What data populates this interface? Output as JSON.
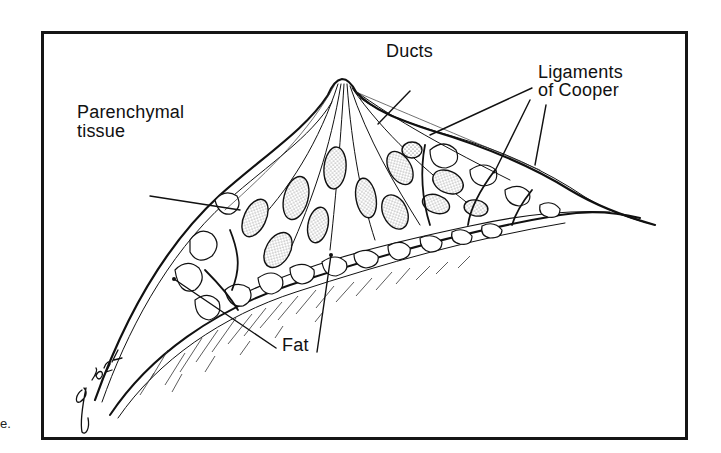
{
  "figure": {
    "stray_text": "e.",
    "signature": "glonz",
    "labels": {
      "ducts": "Ducts",
      "ligaments_line1": "Ligaments",
      "ligaments_line2": "of Cooper",
      "parenchymal_line1": "Parenchymal",
      "parenchymal_line2": "tissue",
      "fat": "Fat"
    },
    "colors": {
      "ink": "#111111",
      "paper": "#ffffff",
      "frame": "#151515",
      "stipple": "#555555"
    }
  }
}
